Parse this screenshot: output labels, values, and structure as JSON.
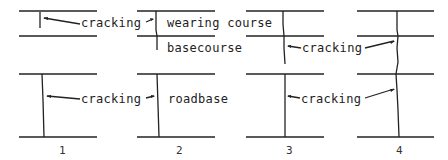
{
  "diagram": {
    "type": "pavement-crack-stages",
    "layers": {
      "wearing_course": "wearing course",
      "basecourse": "basecourse",
      "roadbase": "roadbase"
    },
    "labels": {
      "crack_top": "cracking",
      "crack_mid": "cracking",
      "crack_low_left": "cracking",
      "crack_low_right": "cracking"
    },
    "stages": [
      {
        "number": "1"
      },
      {
        "number": "2"
      },
      {
        "number": "3"
      },
      {
        "number": "4"
      }
    ],
    "colors": {
      "line": "#222222",
      "background": "#ffffff"
    }
  }
}
